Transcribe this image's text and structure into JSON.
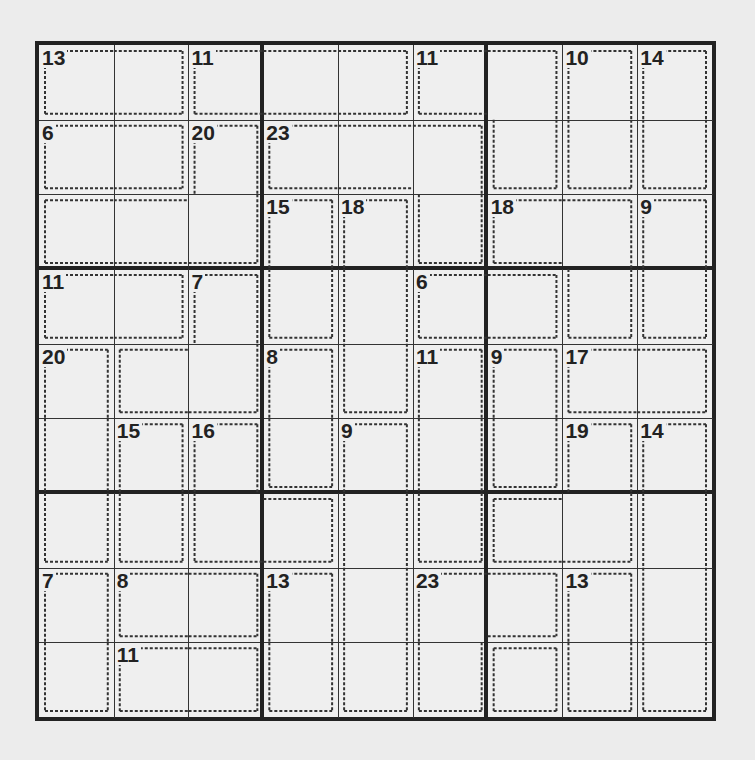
{
  "puzzle": {
    "type": "killer-sudoku",
    "size": 9,
    "cages": [
      {
        "sum": 13,
        "cells": [
          [
            0,
            0
          ],
          [
            0,
            1
          ]
        ]
      },
      {
        "sum": 11,
        "cells": [
          [
            0,
            2
          ],
          [
            0,
            3
          ],
          [
            0,
            4
          ]
        ]
      },
      {
        "sum": 11,
        "cells": [
          [
            0,
            5
          ],
          [
            0,
            6
          ],
          [
            1,
            6
          ]
        ]
      },
      {
        "sum": 10,
        "cells": [
          [
            0,
            7
          ],
          [
            1,
            7
          ]
        ]
      },
      {
        "sum": 14,
        "cells": [
          [
            0,
            8
          ],
          [
            1,
            8
          ]
        ]
      },
      {
        "sum": 6,
        "cells": [
          [
            1,
            0
          ],
          [
            1,
            1
          ]
        ]
      },
      {
        "sum": 20,
        "cells": [
          [
            1,
            2
          ],
          [
            2,
            2
          ],
          [
            2,
            0
          ],
          [
            2,
            1
          ]
        ]
      },
      {
        "sum": 23,
        "cells": [
          [
            1,
            3
          ],
          [
            1,
            4
          ],
          [
            1,
            5
          ],
          [
            2,
            5
          ]
        ]
      },
      {
        "sum": 15,
        "cells": [
          [
            2,
            3
          ],
          [
            3,
            3
          ]
        ]
      },
      {
        "sum": 18,
        "cells": [
          [
            2,
            4
          ],
          [
            3,
            4
          ],
          [
            4,
            4
          ]
        ]
      },
      {
        "sum": 18,
        "cells": [
          [
            2,
            6
          ],
          [
            2,
            7
          ],
          [
            3,
            7
          ]
        ]
      },
      {
        "sum": 9,
        "cells": [
          [
            2,
            8
          ],
          [
            3,
            8
          ]
        ]
      },
      {
        "sum": 11,
        "cells": [
          [
            3,
            0
          ],
          [
            3,
            1
          ]
        ]
      },
      {
        "sum": 7,
        "cells": [
          [
            3,
            2
          ],
          [
            4,
            1
          ],
          [
            4,
            2
          ]
        ]
      },
      {
        "sum": 6,
        "cells": [
          [
            3,
            5
          ],
          [
            3,
            6
          ]
        ]
      },
      {
        "sum": 20,
        "cells": [
          [
            4,
            0
          ],
          [
            5,
            0
          ],
          [
            6,
            0
          ]
        ]
      },
      {
        "sum": 8,
        "cells": [
          [
            4,
            3
          ],
          [
            5,
            3
          ]
        ]
      },
      {
        "sum": 11,
        "cells": [
          [
            4,
            5
          ],
          [
            5,
            5
          ],
          [
            6,
            5
          ]
        ]
      },
      {
        "sum": 9,
        "cells": [
          [
            4,
            6
          ],
          [
            5,
            6
          ]
        ]
      },
      {
        "sum": 17,
        "cells": [
          [
            4,
            7
          ],
          [
            4,
            8
          ]
        ]
      },
      {
        "sum": 15,
        "cells": [
          [
            5,
            1
          ],
          [
            6,
            1
          ]
        ]
      },
      {
        "sum": 16,
        "cells": [
          [
            5,
            2
          ],
          [
            6,
            2
          ],
          [
            6,
            3
          ]
        ]
      },
      {
        "sum": 9,
        "cells": [
          [
            5,
            4
          ],
          [
            6,
            4
          ],
          [
            7,
            4
          ],
          [
            8,
            4
          ]
        ]
      },
      {
        "sum": 19,
        "cells": [
          [
            5,
            7
          ],
          [
            6,
            6
          ],
          [
            6,
            7
          ]
        ]
      },
      {
        "sum": 14,
        "cells": [
          [
            5,
            8
          ],
          [
            6,
            8
          ],
          [
            7,
            8
          ],
          [
            8,
            8
          ]
        ]
      },
      {
        "sum": 7,
        "cells": [
          [
            7,
            0
          ],
          [
            8,
            0
          ]
        ]
      },
      {
        "sum": 8,
        "cells": [
          [
            7,
            1
          ],
          [
            7,
            2
          ]
        ]
      },
      {
        "sum": 13,
        "cells": [
          [
            7,
            3
          ],
          [
            8,
            3
          ]
        ]
      },
      {
        "sum": 23,
        "cells": [
          [
            7,
            5
          ],
          [
            8,
            5
          ],
          [
            7,
            6
          ]
        ]
      },
      {
        "sum": 13,
        "cells": [
          [
            7,
            7
          ],
          [
            8,
            7
          ]
        ]
      },
      {
        "sum": 11,
        "cells": [
          [
            8,
            1
          ],
          [
            8,
            2
          ]
        ]
      },
      {
        "sum": 0,
        "cells": [
          [
            8,
            6
          ]
        ]
      }
    ],
    "clues": [
      {
        "r": 0,
        "c": 0,
        "v": "13"
      },
      {
        "r": 0,
        "c": 2,
        "v": "11"
      },
      {
        "r": 0,
        "c": 5,
        "v": "11"
      },
      {
        "r": 0,
        "c": 7,
        "v": "10"
      },
      {
        "r": 0,
        "c": 8,
        "v": "14"
      },
      {
        "r": 1,
        "c": 0,
        "v": "6"
      },
      {
        "r": 1,
        "c": 2,
        "v": "20"
      },
      {
        "r": 1,
        "c": 3,
        "v": "23"
      },
      {
        "r": 2,
        "c": 3,
        "v": "15"
      },
      {
        "r": 2,
        "c": 4,
        "v": "18"
      },
      {
        "r": 2,
        "c": 6,
        "v": "18"
      },
      {
        "r": 2,
        "c": 8,
        "v": "9"
      },
      {
        "r": 3,
        "c": 0,
        "v": "11"
      },
      {
        "r": 3,
        "c": 2,
        "v": "7"
      },
      {
        "r": 3,
        "c": 5,
        "v": "6"
      },
      {
        "r": 4,
        "c": 0,
        "v": "20"
      },
      {
        "r": 4,
        "c": 3,
        "v": "8"
      },
      {
        "r": 4,
        "c": 5,
        "v": "11"
      },
      {
        "r": 4,
        "c": 6,
        "v": "9"
      },
      {
        "r": 4,
        "c": 7,
        "v": "17"
      },
      {
        "r": 5,
        "c": 1,
        "v": "15"
      },
      {
        "r": 5,
        "c": 2,
        "v": "16"
      },
      {
        "r": 5,
        "c": 4,
        "v": "9"
      },
      {
        "r": 5,
        "c": 7,
        "v": "19"
      },
      {
        "r": 5,
        "c": 8,
        "v": "14"
      },
      {
        "r": 7,
        "c": 0,
        "v": "7"
      },
      {
        "r": 7,
        "c": 1,
        "v": "8"
      },
      {
        "r": 7,
        "c": 3,
        "v": "13"
      },
      {
        "r": 7,
        "c": 5,
        "v": "23"
      },
      {
        "r": 7,
        "c": 7,
        "v": "13"
      },
      {
        "r": 8,
        "c": 1,
        "v": "11"
      }
    ]
  }
}
